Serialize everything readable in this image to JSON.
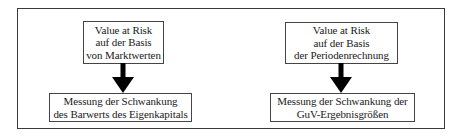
{
  "diagram": {
    "left_column": {
      "top_box": {
        "lines": [
          "Value at Risk",
          "auf der Basis",
          "von Marktwerten"
        ]
      },
      "bottom_box": {
        "lines": [
          "Messung der Schwankung",
          "des Barwerts des Eigenkapitals"
        ]
      },
      "arrow": "arrow-down-icon"
    },
    "right_column": {
      "top_box": {
        "lines": [
          "Value at Risk",
          "auf der Basis",
          "der Periodenrechnung"
        ]
      },
      "bottom_box": {
        "lines": [
          "Messung der Schwankung der",
          "GuV-Ergebnisgrößen"
        ]
      },
      "arrow": "arrow-down-icon"
    },
    "colors": {
      "stroke": "#444444",
      "arrow_fill": "#000000",
      "background": "#ffffff"
    }
  }
}
